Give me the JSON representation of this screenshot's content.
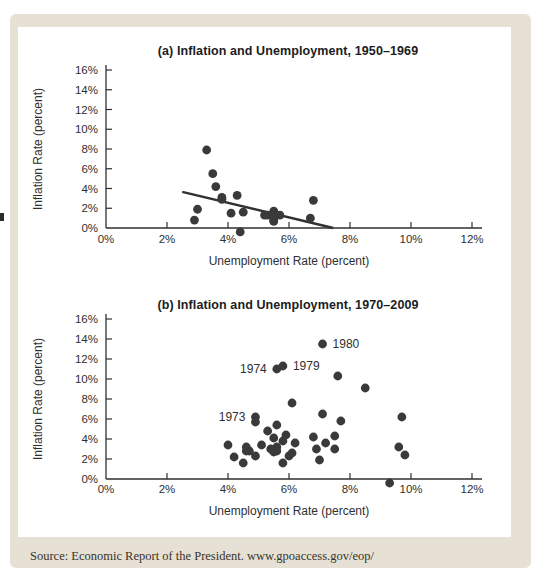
{
  "figure": {
    "source_note": "Source: Economic Report of the President. www.gpoaccess.gov/eop/",
    "colors": {
      "card_bg": "#e6e1d4",
      "chart_bg": "#ffffff",
      "dot": "#3a3a3c",
      "axis": "#2f2f31",
      "text": "#2f2f31",
      "trend": "#313133"
    }
  },
  "chart_data": [
    {
      "type": "scatter",
      "panel": "a",
      "title": "(a) Inflation and Unemployment, 1950–1969",
      "xlabel": "Unemployment Rate (percent)",
      "ylabel": "Inflation Rate (percent)",
      "xlim": [
        0,
        12.4
      ],
      "ylim": [
        -0.8,
        16.6
      ],
      "grid": false,
      "legend": "none",
      "xticks": [
        {
          "v": 0,
          "label": "0%"
        },
        {
          "v": 2,
          "label": "2%"
        },
        {
          "v": 4,
          "label": "4%"
        },
        {
          "v": 6,
          "label": "6%"
        },
        {
          "v": 8,
          "label": "8%"
        },
        {
          "v": 10,
          "label": "10%"
        },
        {
          "v": 12,
          "label": "12%"
        }
      ],
      "yticks": [
        {
          "v": 0,
          "label": "0%"
        },
        {
          "v": 2,
          "label": "2%"
        },
        {
          "v": 4,
          "label": "4%"
        },
        {
          "v": 6,
          "label": "6%"
        },
        {
          "v": 8,
          "label": "8%"
        },
        {
          "v": 10,
          "label": "10%"
        },
        {
          "v": 12,
          "label": "12%"
        },
        {
          "v": 14,
          "label": "14%"
        },
        {
          "v": 16,
          "label": "16%"
        }
      ],
      "points": [
        [
          5.3,
          1.3
        ],
        [
          3.3,
          7.9
        ],
        [
          3.0,
          1.9
        ],
        [
          2.9,
          0.8
        ],
        [
          5.5,
          0.7
        ],
        [
          4.4,
          -0.4
        ],
        [
          4.1,
          1.5
        ],
        [
          4.3,
          3.3
        ],
        [
          6.8,
          2.8
        ],
        [
          5.5,
          0.7
        ],
        [
          5.5,
          1.7
        ],
        [
          6.7,
          1.0
        ],
        [
          5.5,
          1.0
        ],
        [
          5.7,
          1.3
        ],
        [
          5.2,
          1.3
        ],
        [
          4.5,
          1.6
        ],
        [
          3.8,
          2.9
        ],
        [
          3.8,
          3.1
        ],
        [
          3.6,
          4.2
        ],
        [
          3.5,
          5.5
        ]
      ],
      "trend_line": {
        "x1": 2.5,
        "y1": 3.65,
        "x2": 7.45,
        "y2": 0
      },
      "annotations": []
    },
    {
      "type": "scatter",
      "panel": "b",
      "title": "(b) Inflation and Unemployment, 1970–2009",
      "xlabel": "Unemployment Rate (percent)",
      "ylabel": "Inflation Rate (percent)",
      "xlim": [
        0,
        12.4
      ],
      "ylim": [
        -0.8,
        16.6
      ],
      "grid": false,
      "legend": "none",
      "xticks": [
        {
          "v": 0,
          "label": "0%"
        },
        {
          "v": 2,
          "label": "2%"
        },
        {
          "v": 4,
          "label": "4%"
        },
        {
          "v": 6,
          "label": "6%"
        },
        {
          "v": 8,
          "label": "8%"
        },
        {
          "v": 10,
          "label": "10%"
        },
        {
          "v": 12,
          "label": "12%"
        }
      ],
      "yticks": [
        {
          "v": 0,
          "label": "0%"
        },
        {
          "v": 2,
          "label": "2%"
        },
        {
          "v": 4,
          "label": "4%"
        },
        {
          "v": 6,
          "label": "6%"
        },
        {
          "v": 8,
          "label": "8%"
        },
        {
          "v": 10,
          "label": "10%"
        },
        {
          "v": 12,
          "label": "12%"
        },
        {
          "v": 14,
          "label": "14%"
        },
        {
          "v": 16,
          "label": "16%"
        }
      ],
      "points": [
        [
          4.9,
          5.7
        ],
        [
          5.9,
          4.4
        ],
        [
          5.6,
          3.2
        ],
        [
          4.9,
          6.2
        ],
        [
          5.6,
          11.0
        ],
        [
          8.5,
          9.1
        ],
        [
          7.7,
          5.8
        ],
        [
          7.1,
          6.5
        ],
        [
          6.1,
          7.6
        ],
        [
          5.8,
          11.3
        ],
        [
          7.1,
          13.5
        ],
        [
          7.6,
          10.3
        ],
        [
          9.7,
          6.2
        ],
        [
          9.6,
          3.2
        ],
        [
          7.5,
          4.3
        ],
        [
          7.2,
          3.6
        ],
        [
          7.0,
          1.9
        ],
        [
          6.2,
          3.6
        ],
        [
          5.5,
          4.1
        ],
        [
          5.3,
          4.8
        ],
        [
          5.6,
          5.4
        ],
        [
          6.8,
          4.2
        ],
        [
          7.5,
          3.0
        ],
        [
          6.9,
          3.0
        ],
        [
          6.1,
          2.6
        ],
        [
          5.6,
          2.8
        ],
        [
          5.4,
          3.0
        ],
        [
          4.9,
          2.3
        ],
        [
          4.5,
          1.6
        ],
        [
          4.2,
          2.2
        ],
        [
          4.0,
          3.4
        ],
        [
          4.7,
          2.8
        ],
        [
          5.8,
          1.6
        ],
        [
          6.0,
          2.3
        ],
        [
          5.5,
          2.7
        ],
        [
          5.1,
          3.4
        ],
        [
          4.6,
          3.2
        ],
        [
          4.6,
          2.8
        ],
        [
          5.8,
          3.8
        ],
        [
          9.3,
          -0.4
        ],
        [
          9.8,
          2.4
        ]
      ],
      "trend_line": null,
      "annotations": [
        {
          "label": "1973",
          "x": 4.9,
          "y": 6.2,
          "side": "left"
        },
        {
          "label": "1974",
          "x": 5.6,
          "y": 11.0,
          "side": "left"
        },
        {
          "label": "1979",
          "x": 5.8,
          "y": 11.3,
          "side": "right"
        },
        {
          "label": "1980",
          "x": 7.1,
          "y": 13.5,
          "side": "right"
        }
      ]
    }
  ]
}
